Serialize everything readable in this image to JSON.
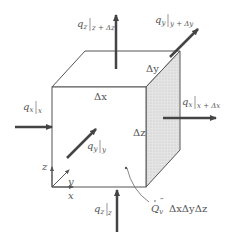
{
  "diagram": {
    "colors": {
      "stroke": "#555555",
      "arrow": "#444444",
      "shaded_face": "#e2e2e2",
      "background": "#ffffff"
    },
    "flux_labels": {
      "qx_in": {
        "q": "q",
        "sub": "x",
        "eval": "x"
      },
      "qx_out": {
        "q": "q",
        "sub": "x",
        "eval": "x + Δx"
      },
      "qy_in": {
        "q": "q",
        "sub": "y",
        "eval": "y"
      },
      "qy_out": {
        "q": "q",
        "sub": "y",
        "eval": "y + Δy"
      },
      "qz_in": {
        "q": "q",
        "sub": "z",
        "eval": "z"
      },
      "qz_out": {
        "q": "q",
        "sub": "z",
        "eval": "z + Δz"
      }
    },
    "dimensions": {
      "dx": "Δx",
      "dy": "Δy",
      "dz": "Δz"
    },
    "generation": {
      "symbol": "Q",
      "sub": "v",
      "sup": "‴",
      "volume": "ΔxΔyΔz"
    },
    "axes": {
      "x": "x",
      "y": "y",
      "z": "z"
    }
  }
}
